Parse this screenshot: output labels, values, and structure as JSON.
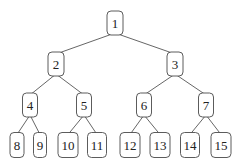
{
  "diagram": {
    "type": "binary-tree",
    "colors": {
      "edge": "#555555",
      "node_border": "#4a4a4a",
      "node_fill": "#ffffff",
      "text": "#222222"
    },
    "nodes": [
      {
        "id": 1,
        "label": "1",
        "x": 115,
        "y": 23,
        "w": 16,
        "h": 24
      },
      {
        "id": 2,
        "label": "2",
        "x": 56,
        "y": 64,
        "w": 16,
        "h": 24
      },
      {
        "id": 3,
        "label": "3",
        "x": 175,
        "y": 64,
        "w": 16,
        "h": 24
      },
      {
        "id": 4,
        "label": "4",
        "x": 30,
        "y": 105,
        "w": 15,
        "h": 24
      },
      {
        "id": 5,
        "label": "5",
        "x": 84,
        "y": 105,
        "w": 15,
        "h": 24
      },
      {
        "id": 6,
        "label": "6",
        "x": 144,
        "y": 105,
        "w": 15,
        "h": 24
      },
      {
        "id": 7,
        "label": "7",
        "x": 206,
        "y": 105,
        "w": 15,
        "h": 24
      },
      {
        "id": 8,
        "label": "8",
        "x": 17,
        "y": 145,
        "w": 14,
        "h": 25
      },
      {
        "id": 9,
        "label": "9",
        "x": 40,
        "y": 145,
        "w": 13,
        "h": 25
      },
      {
        "id": 10,
        "label": "10",
        "x": 68,
        "y": 145,
        "w": 20,
        "h": 25
      },
      {
        "id": 11,
        "label": "11",
        "x": 97,
        "y": 145,
        "w": 19,
        "h": 25
      },
      {
        "id": 12,
        "label": "12",
        "x": 130,
        "y": 145,
        "w": 20,
        "h": 25
      },
      {
        "id": 13,
        "label": "13",
        "x": 160,
        "y": 145,
        "w": 20,
        "h": 25
      },
      {
        "id": 14,
        "label": "14",
        "x": 190,
        "y": 145,
        "w": 19,
        "h": 25
      },
      {
        "id": 15,
        "label": "15",
        "x": 221,
        "y": 145,
        "w": 20,
        "h": 25
      }
    ],
    "edges": [
      [
        1,
        2
      ],
      [
        1,
        3
      ],
      [
        2,
        4
      ],
      [
        2,
        5
      ],
      [
        3,
        6
      ],
      [
        3,
        7
      ],
      [
        4,
        8
      ],
      [
        4,
        9
      ],
      [
        5,
        10
      ],
      [
        5,
        11
      ],
      [
        6,
        12
      ],
      [
        6,
        13
      ],
      [
        7,
        14
      ],
      [
        7,
        15
      ]
    ]
  }
}
